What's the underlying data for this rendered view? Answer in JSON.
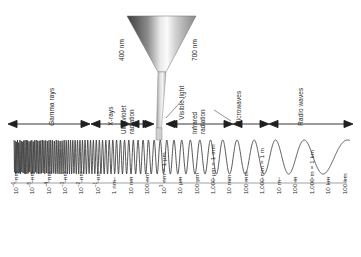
{
  "chart_data": {
    "type": "line",
    "xlabel": "Wavelength",
    "ylabel": "",
    "grid": false,
    "legend_position": "none",
    "categories": [
      "10^-6 nm",
      "10^-5 nm",
      "10^-4 nm",
      "10^-3 nm",
      "10^-2 nm",
      "10^-1 nm",
      "1 nm",
      "10 nm",
      "100 nm",
      "10^3 nm = 1 µm",
      "10 µm",
      "100 µm",
      "1,000 µm = 1 mm",
      "10 mm",
      "100 mm",
      "1,000 mm = 1 m",
      "10 m",
      "100 m",
      "1,000 m = 1 km",
      "10 km",
      "100 km"
    ],
    "values": [
      1,
      1,
      1,
      1,
      1,
      1,
      1,
      1,
      1,
      1,
      1,
      1,
      1,
      1,
      1,
      1,
      1,
      1,
      1,
      1,
      1
    ],
    "annotation": "Waveform amplitude is constant; wavelength increases from left to right across the spectrum.",
    "bands": [
      {
        "name": "Gamma rays",
        "start_index": 0,
        "end_index": 5
      },
      {
        "name": "X-rays",
        "start_index": 5,
        "end_index": 8
      },
      {
        "name": "Ultraviolet radiation",
        "start_index": 8,
        "end_index": 9
      },
      {
        "name": "Visible light",
        "start_index": 9,
        "end_index": 10
      },
      {
        "name": "Infrared radiation",
        "start_index": 10,
        "end_index": 13
      },
      {
        "name": "Microwaves",
        "start_index": 13,
        "end_index": 15
      },
      {
        "name": "Radio waves",
        "start_index": 15,
        "end_index": 20
      }
    ],
    "visible_light_range": {
      "min": "400 nm",
      "max": "700 nm"
    }
  },
  "scale": {
    "ticks": [
      {
        "label_html": "10<sup>–6</sup> nm"
      },
      {
        "label_html": "10<sup>–5</sup> nm"
      },
      {
        "label_html": "10<sup>–4</sup> nm"
      },
      {
        "label_html": "10<sup>–3</sup> nm"
      },
      {
        "label_html": "10<sup>–2</sup> nm"
      },
      {
        "label_html": "10<sup>–1</sup> nm"
      },
      {
        "label_html": "1 nm"
      },
      {
        "label_html": "10 nm"
      },
      {
        "label_html": "100 nm"
      },
      {
        "label_html": "10<sup>3</sup> nm = 1 µm"
      },
      {
        "label_html": "10 µm"
      },
      {
        "label_html": "100 µm"
      },
      {
        "label_html": "1,000 µm = 1 mm"
      },
      {
        "label_html": "10 mm"
      },
      {
        "label_html": "100 mm"
      },
      {
        "label_html": "1,000 mm = 1 m"
      },
      {
        "label_html": "10 m"
      },
      {
        "label_html": "100 m"
      },
      {
        "label_html": "1,000 m = 1 km"
      },
      {
        "label_html": "10 km"
      },
      {
        "label_html": "100 km"
      }
    ]
  },
  "bands": {
    "gamma": "Gamma rays",
    "xray": "X-rays",
    "uv_line1": "Ultraviolet",
    "uv_line2": "radiation",
    "visible": "Visible light",
    "ir_line1": "Infrared",
    "ir_line2": "radiation",
    "microwaves": "Microwaves",
    "radio": "Radio waves"
  },
  "funnel": {
    "left_nm": "400 nm",
    "right_nm": "700 nm"
  },
  "colors": {
    "background": "#ffffff",
    "ink": "#1f1f1f",
    "label": "#262626",
    "funnel_dark": "#4a4a4a",
    "funnel_light": "#f2f2f2",
    "stem": "#bdbdbd",
    "wave": "#3a3a3a"
  }
}
